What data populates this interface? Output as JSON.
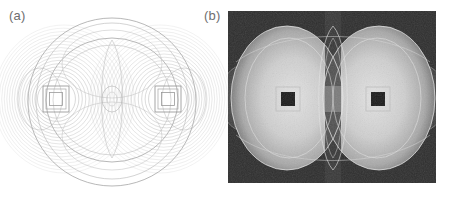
{
  "figure": {
    "caption_a": "(a)",
    "caption_b": "(b)",
    "label_color": "#6e6e6e",
    "background_color": "#ffffff"
  },
  "chart_data": {
    "type": "heatmap",
    "title": "",
    "subtitle": "",
    "xlabel": "",
    "ylabel": "",
    "grid": false,
    "legend": null,
    "panels": [
      {
        "id": "a",
        "label": "(a)",
        "style": "contour-lines",
        "background": "#ffffff",
        "line_color": "#a9a9a9",
        "description": "Contour plot of field distribution on white background",
        "center": [
          112,
          102
        ],
        "bounds": [
          8,
          11,
          216,
          192
        ],
        "outer_circle_radius": 84,
        "inner_ellipse_rx": 66,
        "inner_ellipse_ry": 62,
        "core_ellipse_rx": 10,
        "core_ellipse_ry": 13,
        "emitters": [
          {
            "name": "left-square",
            "cx": 56,
            "cy": 99,
            "outer": 26,
            "inner": 13
          },
          {
            "name": "right-square",
            "cx": 168,
            "cy": 99,
            "outer": 26,
            "inner": 13
          }
        ],
        "side_lobe_rx": 20,
        "side_lobe_ry": 30,
        "contour_ring_count": 18
      },
      {
        "id": "b",
        "label": "(b)",
        "style": "intensity-map",
        "background": "#2e2e2e",
        "line_color": "#d8d8d8",
        "description": "Grayscale intensity map of field magnitude on dark background",
        "bounds": [
          228,
          11,
          436,
          183
        ],
        "center": [
          332,
          99
        ],
        "lobes": [
          {
            "name": "left-lobe",
            "cx": 287,
            "cy": 98,
            "rx": 56,
            "ry": 72
          },
          {
            "name": "right-lobe",
            "cx": 379,
            "cy": 98,
            "rx": 56,
            "ry": 72
          }
        ],
        "emitters": [
          {
            "name": "left-square-core",
            "cx": 288,
            "cy": 99,
            "outer": 24,
            "inner": 12
          },
          {
            "name": "right-square-core",
            "cx": 378,
            "cy": 99,
            "outer": 24,
            "inner": 12
          }
        ],
        "side_lobe_rx": 22,
        "side_lobe_ry": 32,
        "intensity_min": 0,
        "intensity_max": 1
      }
    ]
  }
}
